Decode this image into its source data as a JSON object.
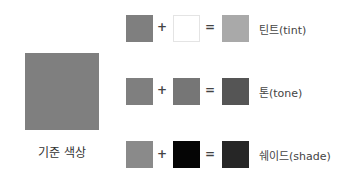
{
  "base": {
    "label": "기준 색상",
    "color": "#7f7f7f"
  },
  "operators": {
    "plus": "+",
    "equals": "="
  },
  "rows": [
    {
      "name": "tint",
      "label": "틴트(tint)",
      "base_color": "#7f7f7f",
      "mix_color": "#ffffff",
      "result_color": "#a9a9a9"
    },
    {
      "name": "tone",
      "label": "톤(tone)",
      "base_color": "#7f7f7f",
      "mix_color": "#767676",
      "result_color": "#555555"
    },
    {
      "name": "shade",
      "label": "쉐이드(shade)",
      "base_color": "#8a8a8a",
      "mix_color": "#050505",
      "result_color": "#262626"
    }
  ]
}
